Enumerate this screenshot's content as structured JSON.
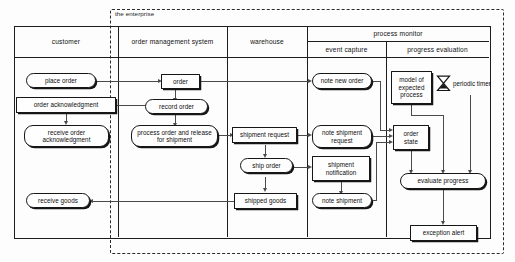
{
  "diagram": {
    "title": "the enterprise",
    "boundary_label": "the enterprise",
    "lanes": [
      {
        "id": "customer",
        "label": "customer"
      },
      {
        "id": "oms",
        "label": "order management system"
      },
      {
        "id": "warehouse",
        "label": "warehouse"
      },
      {
        "id": "process-monitor",
        "label": "process monitor"
      }
    ],
    "sublanes": [
      {
        "id": "event-capture",
        "label": "event capture",
        "parent": "process-monitor"
      },
      {
        "id": "progress-evaluation",
        "label": "progress evaluation",
        "parent": "process-monitor"
      }
    ],
    "nodes": {
      "place_order": "place order",
      "order_acknowledgment": "order acknowledgment",
      "receive_order_acknowledgment": "receive order acknowledgment",
      "receive_goods": "receive goods",
      "order": "order",
      "record_order": "record order",
      "process_order_release": "process order and release for shipment",
      "shipment_request": "shipment request",
      "ship_order": "ship order",
      "shipped_goods": "shipped goods",
      "note_new_order": "note new order",
      "note_shipment_request": "note shipment request",
      "shipment_notification": "shipment notification",
      "note_shipment": "note shipment",
      "model_of_expected_process": "model of expected process",
      "periodic_timer": "periodic timer",
      "order_state": "order state",
      "evaluate_progress": "evaluate progress",
      "exception_alert": "exception alert"
    },
    "icons": {
      "timer": "hourglass-icon"
    },
    "colors": {
      "stroke": "#161616",
      "connector": "#4a4a4a",
      "boundary": "#2b2b2b",
      "background": "#fdfdfd"
    }
  }
}
